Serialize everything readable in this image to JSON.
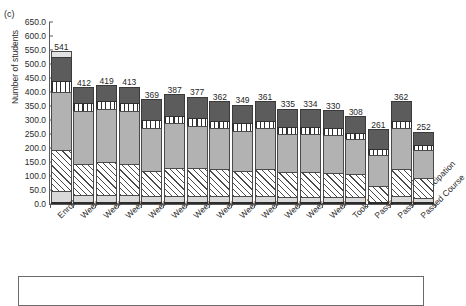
{
  "panel": {
    "letter": "(c)"
  },
  "axes": {
    "ylabel": "Number of students",
    "xlabel": "",
    "yticks": [
      "0.0",
      "50.0",
      "100.0",
      "150.0",
      "200.0",
      "250.0",
      "300.0",
      "350.0",
      "400.0",
      "450.0",
      "500.0",
      "550.0",
      "600.0",
      "650.0"
    ]
  },
  "legend": {
    "present": true,
    "entries": []
  },
  "chart_data": {
    "type": "bar",
    "subtype": "stacked-bar",
    "title": "",
    "xlabel": "",
    "ylabel": "Number of students",
    "ylim": [
      0,
      650
    ],
    "ytick_step": 50,
    "grid": false,
    "legend_position": "bottom",
    "categories": [
      "Enrolled",
      "Week 1",
      "Week 2",
      "Week 3",
      "Week 4",
      "Week 5",
      "Week 6",
      "Week 7",
      "Week 8",
      "Week 9",
      "Week 10",
      "Week 11",
      "Week 12",
      "Took Exam",
      "Passed Exam",
      "Passed Participation",
      "Passed Course"
    ],
    "totals": [
      541,
      412,
      419,
      413,
      369,
      387,
      377,
      362,
      349,
      361,
      335,
      334,
      330,
      308,
      261,
      362,
      252
    ],
    "series": [
      {
        "name": "segment-1-light-gray",
        "fill": "light-gray",
        "values": [
          42,
          28,
          26,
          26,
          22,
          24,
          24,
          22,
          22,
          22,
          20,
          20,
          20,
          18,
          0,
          22,
          16
        ]
      },
      {
        "name": "segment-2-diagonal-hatch",
        "fill": "white-diagonal-hatch",
        "values": [
          144,
          108,
          118,
          113,
          92,
          100,
          98,
          96,
          92,
          96,
          88,
          88,
          86,
          82,
          58,
          98,
          72
        ]
      },
      {
        "name": "segment-3-medium-gray",
        "fill": "medium-gray",
        "values": [
          208,
          192,
          190,
          188,
          152,
          158,
          152,
          148,
          142,
          148,
          136,
          136,
          136,
          126,
          110,
          146,
          98
        ]
      },
      {
        "name": "segment-4-vertical-stripe",
        "fill": "white-vertical-stripe",
        "values": [
          40,
          26,
          28,
          28,
          28,
          28,
          28,
          26,
          26,
          26,
          24,
          24,
          24,
          22,
          22,
          26,
          20
        ]
      },
      {
        "name": "segment-5-dark-gray",
        "fill": "dark-gray",
        "values": [
          86,
          58,
          57,
          58,
          75,
          77,
          75,
          70,
          67,
          69,
          67,
          66,
          64,
          60,
          71,
          70,
          46
        ]
      },
      {
        "name": "segment-6-cap-light",
        "fill": "cap-light-gray",
        "values": [
          21,
          0,
          0,
          0,
          0,
          0,
          0,
          0,
          0,
          0,
          0,
          0,
          0,
          0,
          0,
          0,
          0
        ]
      }
    ]
  }
}
